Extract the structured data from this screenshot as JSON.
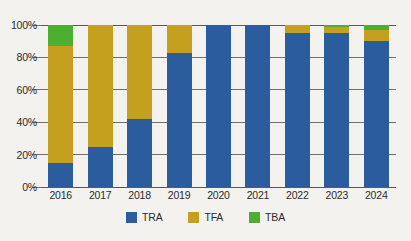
{
  "chart_data": {
    "type": "bar",
    "subtype": "stacked-100-percent",
    "title": "",
    "subtitle": "",
    "xlabel": "",
    "ylabel": "",
    "categories": [
      "2016",
      "2017",
      "2018",
      "2019",
      "2020",
      "2021",
      "2022",
      "2023",
      "2024"
    ],
    "series": [
      {
        "name": "TRA",
        "color": "#2B5C9E",
        "values": [
          15,
          24.5,
          42,
          83,
          100,
          100,
          95,
          95,
          90
        ]
      },
      {
        "name": "TFA",
        "color": "#C4A01E",
        "values": [
          72,
          75.5,
          58,
          17,
          0,
          0,
          5,
          3.5,
          7
        ]
      },
      {
        "name": "TBA",
        "color": "#4CAF2F",
        "values": [
          13,
          0,
          0,
          0,
          0,
          0,
          0,
          1.5,
          3
        ]
      }
    ],
    "ylim": [
      0,
      100
    ],
    "y_ticks": [
      0,
      20,
      40,
      60,
      80,
      100
    ],
    "y_tick_labels": [
      "0%",
      "20%",
      "40%",
      "60%",
      "80%",
      "100%"
    ],
    "grid": true,
    "grid_axis": "y",
    "legend_position": "bottom"
  },
  "legend": {
    "items": [
      {
        "label": "TRA",
        "color": "#2B5C9E"
      },
      {
        "label": "TFA",
        "color": "#C4A01E"
      },
      {
        "label": "TBA",
        "color": "#4CAF2F"
      }
    ]
  },
  "colors": {
    "background": "#f3f2ee",
    "grid": "#6f6f6f",
    "axis": "#5a5a5a",
    "text": "#2a2a2a",
    "series_tra": "#2B5C9E",
    "series_tfa": "#C4A01E",
    "series_tba": "#4CAF2F"
  }
}
